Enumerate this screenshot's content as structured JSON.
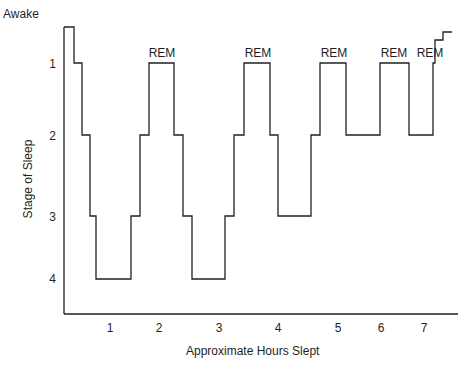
{
  "chart_data": {
    "type": "line",
    "subtype": "step",
    "title": "",
    "xlabel": "Approximate Hours Slept",
    "ylabel": "Stage of Sleep",
    "x_ticks": [
      "1",
      "2",
      "3",
      "4",
      "5",
      "6",
      "7"
    ],
    "y_ticks": [
      "Awake",
      "1",
      "2",
      "3",
      "4"
    ],
    "y_axis_inverted": true,
    "grid": false,
    "annotations": [
      "REM",
      "REM",
      "REM",
      "REM",
      "REM"
    ],
    "series": [
      {
        "name": "Sleep stage",
        "color": "#231f20",
        "points": [
          {
            "hour": 0.0,
            "stage": "Awake"
          },
          {
            "hour": 0.1,
            "stage": 1
          },
          {
            "hour": 0.2,
            "stage": 2
          },
          {
            "hour": 0.3,
            "stage": 3
          },
          {
            "hour": 0.4,
            "stage": 4
          },
          {
            "hour": 0.75,
            "stage": 3
          },
          {
            "hour": 0.85,
            "stage": 2
          },
          {
            "hour": 0.95,
            "stage": 1,
            "label": "REM"
          },
          {
            "hour": 1.2,
            "stage": 2
          },
          {
            "hour": 1.3,
            "stage": 3
          },
          {
            "hour": 1.4,
            "stage": 4
          },
          {
            "hour": 1.75,
            "stage": 3
          },
          {
            "hour": 1.85,
            "stage": 2
          },
          {
            "hour": 1.95,
            "stage": 1,
            "label": "REM"
          },
          {
            "hour": 2.25,
            "stage": 2
          },
          {
            "hour": 2.35,
            "stage": 3
          },
          {
            "hour": 2.7,
            "stage": 2
          },
          {
            "hour": 2.8,
            "stage": 1,
            "label": "REM"
          },
          {
            "hour": 3.1,
            "stage": 2
          },
          {
            "hour": 3.45,
            "stage": 1,
            "label": "REM"
          },
          {
            "hour": 3.75,
            "stage": 2
          },
          {
            "hour": 4.0,
            "stage": 1,
            "label": "REM"
          },
          {
            "hour": 4.1,
            "stage": "Awake"
          }
        ]
      }
    ],
    "pixel_path": [
      [
        64,
        27
      ],
      [
        74,
        27
      ],
      [
        74,
        63
      ],
      [
        82,
        63
      ],
      [
        82,
        135
      ],
      [
        90,
        135
      ],
      [
        90,
        216
      ],
      [
        96,
        216
      ],
      [
        96,
        279
      ],
      [
        131,
        279
      ],
      [
        131,
        216
      ],
      [
        140,
        216
      ],
      [
        140,
        135
      ],
      [
        149,
        135
      ],
      [
        149,
        63
      ],
      [
        174,
        63
      ],
      [
        174,
        135
      ],
      [
        183,
        135
      ],
      [
        183,
        216
      ],
      [
        192,
        216
      ],
      [
        192,
        279
      ],
      [
        225,
        279
      ],
      [
        225,
        216
      ],
      [
        234,
        216
      ],
      [
        234,
        135
      ],
      [
        244,
        135
      ],
      [
        244,
        63
      ],
      [
        270,
        63
      ],
      [
        270,
        135
      ],
      [
        278,
        135
      ],
      [
        278,
        216
      ],
      [
        311,
        216
      ],
      [
        311,
        135
      ],
      [
        320,
        135
      ],
      [
        320,
        63
      ],
      [
        346,
        63
      ],
      [
        346,
        135
      ],
      [
        380,
        135
      ],
      [
        380,
        63
      ],
      [
        409,
        63
      ],
      [
        409,
        135
      ],
      [
        433,
        135
      ],
      [
        433,
        63
      ],
      [
        435,
        63
      ],
      [
        435,
        40
      ],
      [
        443,
        40
      ],
      [
        443,
        32
      ],
      [
        452,
        32
      ]
    ]
  },
  "labels": {
    "ylabel": "Stage of Sleep",
    "xlabel": "Approximate Hours Slept",
    "awake": "Awake",
    "y1": "1",
    "y2": "2",
    "y3": "3",
    "y4": "4",
    "x1": "1",
    "x2": "2",
    "x3": "3",
    "x4": "4",
    "x5": "5",
    "x6": "6",
    "x7": "7",
    "rem": "REM"
  }
}
